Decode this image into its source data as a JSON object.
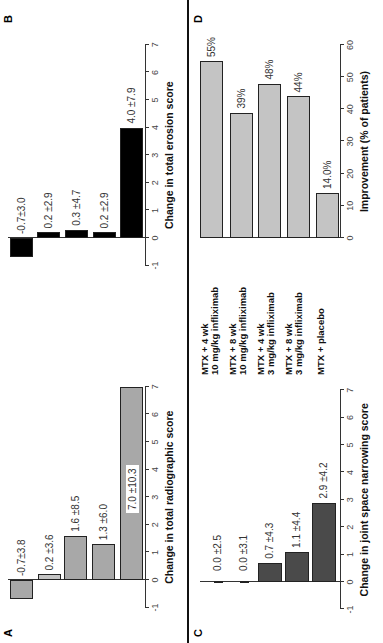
{
  "figure": {
    "groups": [
      {
        "line1": "MTX + 4 wk",
        "line2": "10 mg/kg infliximab"
      },
      {
        "line1": "MTX + 8 wk",
        "line2": "10 mg/kg infliximab"
      },
      {
        "line1": "MTX + 4 wk",
        "line2": "3 mg/kg infliximab"
      },
      {
        "line1": "MTX + 8 wk",
        "line2": "3 mg/kg infliximab"
      },
      {
        "line1": "MTX + placebo",
        "line2": ""
      }
    ],
    "panels": {
      "A": {
        "letter": "A",
        "xlabel": "Change in total radiographic score",
        "ticks": [
          "-1",
          "0",
          "1",
          "2",
          "3",
          "4",
          "5",
          "6",
          "7"
        ],
        "labels": [
          "-0.7±3.8",
          "0.2 ±3.6",
          "1.6 ±8.5",
          "1.3 ±6.0",
          "7.0 ±10.3"
        ]
      },
      "B": {
        "letter": "B",
        "xlabel": "Change in total erosion score",
        "ticks": [
          "-1",
          "0",
          "1",
          "2",
          "3",
          "4",
          "5",
          "6",
          "7"
        ],
        "labels": [
          "-0.7±3.0",
          "0.2 ±2.9",
          "0.3 ±4.7",
          "0.2 ±2.9",
          "4.0 ±7.9"
        ]
      },
      "C": {
        "letter": "C",
        "xlabel": "Change in joint space narrowing score",
        "ticks": [
          "-1",
          "0",
          "1",
          "2",
          "3",
          "4",
          "5",
          "6",
          "7"
        ],
        "labels": [
          "0.0 ±2.5",
          "0.0 ±3.1",
          "0.7 ±4.3",
          "1.1 ±4.4",
          "2.9 ±4.2"
        ]
      },
      "D": {
        "letter": "D",
        "xlabel": "Improvement (% of patients)",
        "ticks": [
          "0",
          "10",
          "20",
          "30",
          "40",
          "50",
          "60"
        ],
        "labels": [
          "55%",
          "39%",
          "48%",
          "44%",
          "14.0%"
        ]
      }
    }
  },
  "chart_data": [
    {
      "type": "bar",
      "orientation": "horizontal",
      "panel": "A",
      "title": "",
      "xlabel": "Change in total radiographic score",
      "ylabel": "",
      "categories": [
        "MTX + 4 wk 10 mg/kg infliximab",
        "MTX + 8 wk 10 mg/kg infliximab",
        "MTX + 4 wk 3 mg/kg infliximab",
        "MTX + 8 wk 3 mg/kg infliximab",
        "MTX + placebo"
      ],
      "values": [
        -0.7,
        0.2,
        1.6,
        1.3,
        7.0
      ],
      "errors": [
        3.8,
        3.6,
        8.5,
        6.0,
        10.3
      ],
      "xlim": [
        -1,
        7
      ],
      "grid": false
    },
    {
      "type": "bar",
      "orientation": "horizontal",
      "panel": "B",
      "title": "",
      "xlabel": "Change in total erosion score",
      "ylabel": "",
      "categories": [
        "MTX + 4 wk 10 mg/kg infliximab",
        "MTX + 8 wk 10 mg/kg infliximab",
        "MTX + 4 wk 3 mg/kg infliximab",
        "MTX + 8 wk 3 mg/kg infliximab",
        "MTX + placebo"
      ],
      "values": [
        -0.7,
        0.2,
        0.3,
        0.2,
        4.0
      ],
      "errors": [
        3.0,
        2.9,
        4.7,
        2.9,
        7.9
      ],
      "xlim": [
        -1,
        7
      ],
      "grid": false
    },
    {
      "type": "bar",
      "orientation": "horizontal",
      "panel": "C",
      "title": "",
      "xlabel": "Change in joint space narrowing score",
      "ylabel": "",
      "categories": [
        "MTX + 4 wk 10 mg/kg infliximab",
        "MTX + 8 wk 10 mg/kg infliximab",
        "MTX + 4 wk 3 mg/kg infliximab",
        "MTX + 8 wk 3 mg/kg infliximab",
        "MTX + placebo"
      ],
      "values": [
        0.0,
        0.0,
        0.7,
        1.1,
        2.9
      ],
      "errors": [
        2.5,
        3.1,
        4.3,
        4.4,
        4.2
      ],
      "xlim": [
        -1,
        7
      ],
      "grid": false
    },
    {
      "type": "bar",
      "orientation": "horizontal",
      "panel": "D",
      "title": "",
      "xlabel": "Improvement (% of patients)",
      "ylabel": "",
      "categories": [
        "MTX + 4 wk 10 mg/kg infliximab",
        "MTX + 8 wk 10 mg/kg infliximab",
        "MTX + 4 wk 3 mg/kg infliximab",
        "MTX + 8 wk 3 mg/kg infliximab",
        "MTX + placebo"
      ],
      "values": [
        55,
        39,
        48,
        44,
        14.0
      ],
      "xlim": [
        0,
        60
      ],
      "grid": false
    }
  ]
}
